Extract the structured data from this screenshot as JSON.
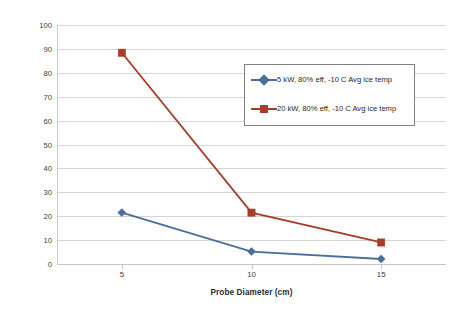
{
  "chart_data": {
    "type": "line",
    "title": "",
    "xlabel": "Probe Diameter (cm)",
    "ylabel": "Descent Speed (m/hr)",
    "x": [
      5,
      10,
      15
    ],
    "xtick_labels": [
      "5",
      "10",
      "15"
    ],
    "xlim": [
      2.5,
      17.5
    ],
    "ylim": [
      0,
      100
    ],
    "ytick_labels": [
      "0",
      "10",
      "20",
      "30",
      "40",
      "50",
      "60",
      "70",
      "80",
      "90",
      "100"
    ],
    "ytick_values": [
      0,
      10,
      20,
      30,
      40,
      50,
      60,
      70,
      80,
      90,
      100
    ],
    "grid": "horizontal",
    "legend_position": "inside-upper-right",
    "series": [
      {
        "name": "5 kW, 80% eff, -10 C Avg ice temp",
        "values": [
          21.5,
          5.2,
          2.1
        ],
        "color": "#4A6E9B",
        "marker": "diamond"
      },
      {
        "name": "20 kW, 80% eff, -10 C Avg ice temp",
        "values": [
          88.4,
          21.5,
          9.0
        ],
        "color": "#A63D28",
        "marker": "square"
      }
    ]
  },
  "colors": {
    "series_blue": "#4A6E9B",
    "series_red": "#A63D28",
    "gridline": "#D5D5D5",
    "axis": "#C4C4C4",
    "text": "#2B2B2B",
    "legend_border": "#808080",
    "background": "#FFFFFF"
  }
}
